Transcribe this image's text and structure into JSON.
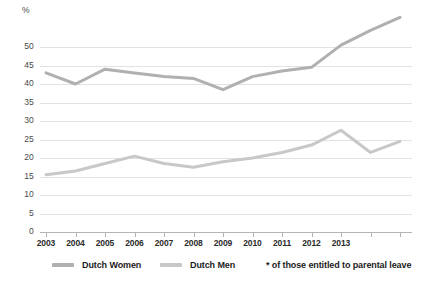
{
  "chart_data": {
    "type": "line",
    "title": "",
    "xlabel": "",
    "ylabel": "%",
    "y_unit_label": "%",
    "ylim": [
      0,
      60
    ],
    "yticks": [
      0,
      5,
      10,
      15,
      20,
      25,
      30,
      35,
      40,
      45,
      50
    ],
    "ytick_labels": [
      "0",
      "5",
      "10",
      "15",
      "20",
      "25",
      "30",
      "35",
      "40",
      "45",
      "50"
    ],
    "grid": true,
    "grid_axis": "y",
    "legend_position": "bottom",
    "x": [
      2003,
      2004,
      2005,
      2006,
      2007,
      2008,
      2009,
      2010,
      2011,
      2012,
      2013,
      2014,
      2015
    ],
    "xtick_labels": [
      "2003",
      "2004",
      "2005",
      "2006",
      "2007",
      "2008",
      "2009",
      "2010",
      "2011",
      "2012",
      "2013",
      "",
      ""
    ],
    "series": [
      {
        "name": "Dutch Women",
        "color": "#b0b0b0",
        "values": [
          43.0,
          40.0,
          44.0,
          43.0,
          42.0,
          41.5,
          38.5,
          42.0,
          43.5,
          44.5,
          50.5,
          54.5,
          58.0
        ]
      },
      {
        "name": "Dutch Men",
        "color": "#c8c8c8",
        "values": [
          15.5,
          16.5,
          18.5,
          20.5,
          18.5,
          17.5,
          19.0,
          20.0,
          21.5,
          23.5,
          27.5,
          21.5,
          24.5
        ]
      }
    ],
    "annotations": [
      "* of those entitled to parental leave"
    ]
  },
  "legend": {
    "entries": [
      {
        "label": "Dutch Women"
      },
      {
        "label": "Dutch Men"
      }
    ],
    "note": "* of those entitled to parental leave"
  },
  "colors": {
    "series_women": "#b0b0b0",
    "series_men": "#c8c8c8",
    "grid": "#e2e2e2",
    "axis": "#b4b4b4",
    "tick_text": "#4a4a4a",
    "label_text": "#1c1c1c"
  }
}
